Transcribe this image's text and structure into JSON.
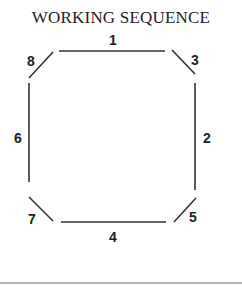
{
  "title": "WORKING SEQUENCE",
  "labels": {
    "s1": "1",
    "s2": "2",
    "s3": "3",
    "s4": "4",
    "s5": "5",
    "s6": "6",
    "s7": "7",
    "s8": "8"
  },
  "colors": {
    "stroke": "#333333",
    "text": "#222222",
    "rule": "#666666"
  }
}
